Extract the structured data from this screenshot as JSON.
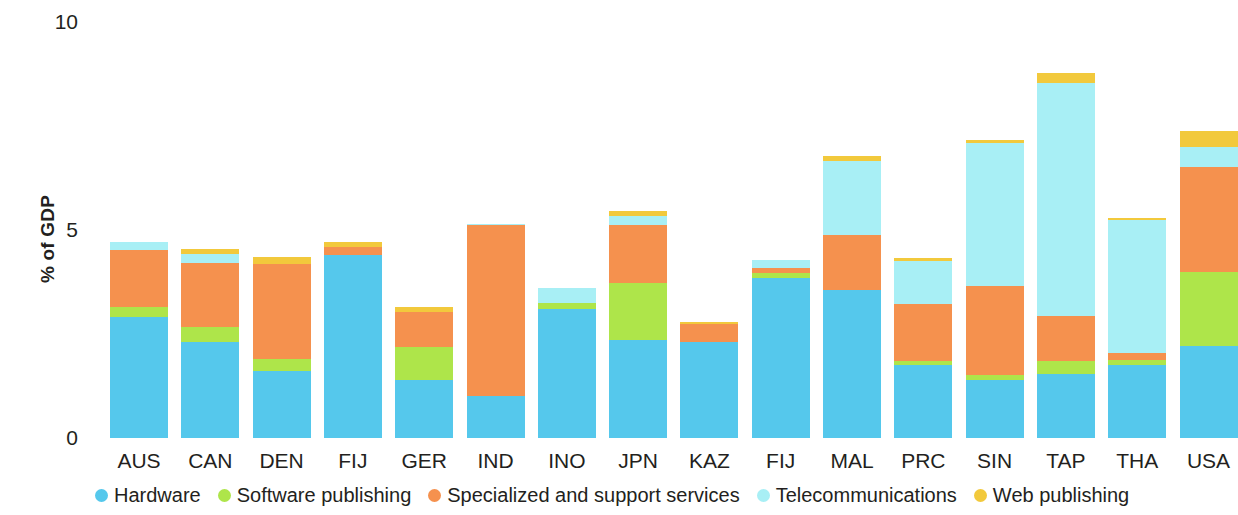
{
  "chart_data": {
    "type": "bar",
    "stacked": true,
    "title": "",
    "subtitle": "",
    "xlabel": "",
    "ylabel": "% of GDP",
    "ylim": [
      0,
      10
    ],
    "yticks": [
      0,
      5,
      10
    ],
    "ytick_labels": [
      "0",
      "5",
      "10"
    ],
    "grid": false,
    "legend_position": "bottom",
    "categories": [
      "AUS",
      "CAN",
      "DEN",
      "FIJ",
      "GER",
      "IND",
      "INO",
      "JPN",
      "KAZ",
      "FIJ",
      "MAL",
      "PRC",
      "SIN",
      "TAP",
      "THA",
      "USA"
    ],
    "series": [
      {
        "name": "Hardware",
        "color": "#55c8ec",
        "values": [
          2.9,
          2.3,
          1.6,
          4.4,
          1.4,
          1.0,
          3.1,
          2.35,
          2.3,
          3.85,
          3.55,
          1.75,
          1.4,
          1.55,
          1.75,
          2.2
        ]
      },
      {
        "name": "Software publishing",
        "color": "#aee54a",
        "values": [
          0.26,
          0.36,
          0.3,
          0.0,
          0.8,
          0.0,
          0.15,
          1.37,
          0.0,
          0.12,
          0.0,
          0.1,
          0.12,
          0.31,
          0.12,
          1.8
        ]
      },
      {
        "name": "Specialized and support services",
        "color": "#f5914e",
        "values": [
          1.37,
          1.55,
          2.28,
          0.19,
          0.82,
          4.12,
          0.0,
          1.39,
          0.43,
          0.12,
          1.32,
          1.37,
          2.14,
          1.08,
          0.17,
          2.52
        ]
      },
      {
        "name": "Telecommunications",
        "color": "#a8eff5",
        "values": [
          0.19,
          0.22,
          0.0,
          0.0,
          0.0,
          0.02,
          0.36,
          0.22,
          0.0,
          0.19,
          1.8,
          1.03,
          3.44,
          5.6,
          3.2,
          0.48
        ]
      },
      {
        "name": "Web publishing",
        "color": "#f2c93c",
        "values": [
          0.0,
          0.12,
          0.17,
          0.12,
          0.14,
          0.0,
          0.0,
          0.12,
          0.07,
          0.0,
          0.12,
          0.07,
          0.07,
          0.24,
          0.05,
          0.38
        ]
      }
    ],
    "totals": [
      4.72,
      4.55,
      4.35,
      4.71,
      3.16,
      5.14,
      3.61,
      5.45,
      2.8,
      4.28,
      6.79,
      4.32,
      7.17,
      8.78,
      5.29,
      7.38
    ]
  },
  "axis": {
    "y_title": "% of GDP"
  },
  "legend": {
    "items": [
      {
        "label": "Hardware",
        "color": "#55c8ec"
      },
      {
        "label": "Software publishing",
        "color": "#aee54a"
      },
      {
        "label": "Specialized and support services",
        "color": "#f5914e"
      },
      {
        "label": "Telecommunications",
        "color": "#a8eff5"
      },
      {
        "label": "Web publishing",
        "color": "#f2c93c"
      }
    ]
  }
}
